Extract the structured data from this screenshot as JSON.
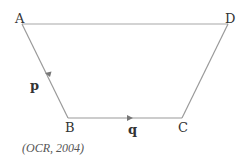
{
  "diagram": {
    "type": "trapezium",
    "vertices": {
      "A": {
        "label": "A",
        "x": 22,
        "y": 24
      },
      "D": {
        "label": "D",
        "x": 228,
        "y": 24
      },
      "B": {
        "label": "B",
        "x": 68,
        "y": 118
      },
      "C": {
        "label": "C",
        "x": 182,
        "y": 118
      }
    },
    "vectors": [
      {
        "from": "A",
        "to": "B",
        "label": "p"
      },
      {
        "from": "B",
        "to": "C",
        "label": "q"
      }
    ],
    "colors": {
      "line": "#9a9a9a",
      "arrow": "#777777",
      "text": "#333333"
    }
  },
  "caption": "(OCR, 2004)"
}
